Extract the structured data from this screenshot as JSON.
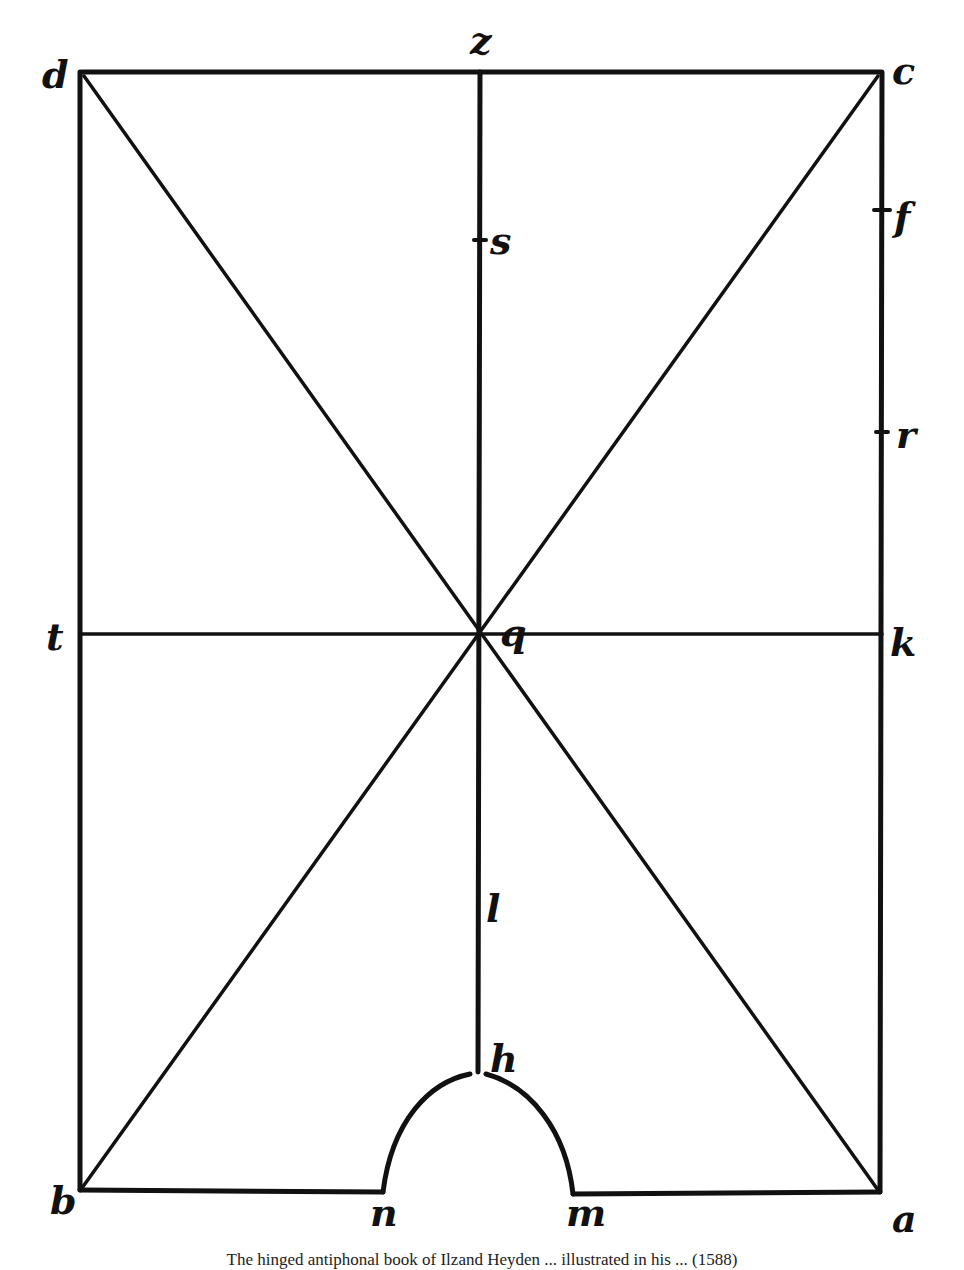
{
  "figure": {
    "type": "geometric construction diagram",
    "labels": {
      "d": "d",
      "z": "z",
      "c": "c",
      "s": "s",
      "f": "f",
      "r": "r",
      "t": "t",
      "q": "q",
      "k": "k",
      "l": "l",
      "h": "h",
      "b": "b",
      "n": "n",
      "m": "m",
      "a": "a"
    },
    "colors": {
      "ink": "#111111",
      "paper": "#ffffff"
    }
  },
  "caption": "The hinged antiphonal book of Ilzand Heyden ... illustrated in his ... (1588)"
}
